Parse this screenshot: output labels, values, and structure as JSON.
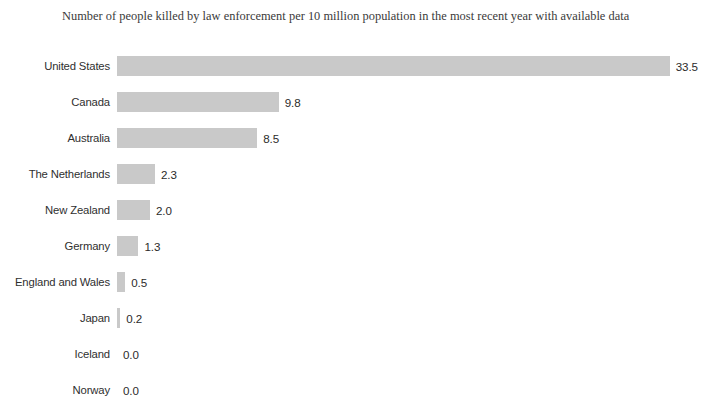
{
  "chart_data": {
    "type": "bar",
    "orientation": "horizontal",
    "title": "Number of people killed by law enforcement per 10 million population in the most recent year with available data",
    "xlabel": "",
    "ylabel": "",
    "categories": [
      "United States",
      "Canada",
      "Australia",
      "The Netherlands",
      "New Zealand",
      "Germany",
      "England and Wales",
      "Japan",
      "Iceland",
      "Norway"
    ],
    "values": [
      33.5,
      9.8,
      8.5,
      2.3,
      2.0,
      1.3,
      0.5,
      0.2,
      0.0,
      0.0
    ],
    "value_labels": [
      "33.5",
      "9.8",
      "8.5",
      "2.3",
      "2.0",
      "1.3",
      "0.5",
      "0.2",
      "0.0",
      "0.0"
    ],
    "xlim": [
      0,
      33.5
    ],
    "grid": false,
    "legend": false,
    "bar_color": "#c9c9c9",
    "background_color": "#ffffff",
    "text_color": "#2f2f2f"
  }
}
